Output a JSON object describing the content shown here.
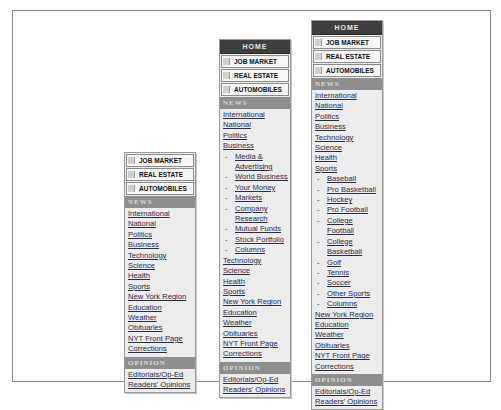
{
  "colors": {
    "home_bg": "#3e3e3e",
    "section_bg": "#8e8e8e",
    "panel_bg": "#ececec",
    "link": "#2a2a4a"
  },
  "columns": [
    {
      "has_home": false,
      "home_label": "",
      "classifieds": [
        "JOB MARKET",
        "REAL ESTATE",
        "AUTOMOBILES"
      ],
      "news_header": "NEWS",
      "news_items": [
        {
          "label": "International",
          "sub": false
        },
        {
          "label": "National",
          "sub": false
        },
        {
          "label": "Politics",
          "sub": false
        },
        {
          "label": "Business",
          "sub": false
        },
        {
          "label": "Technology",
          "sub": false
        },
        {
          "label": "Science",
          "sub": false
        },
        {
          "label": "Health",
          "sub": false
        },
        {
          "label": "Sports",
          "sub": false
        },
        {
          "label": "New York Region",
          "sub": false
        },
        {
          "label": "Education",
          "sub": false
        },
        {
          "label": "Weather",
          "sub": false
        },
        {
          "label": "Obituaries",
          "sub": false
        },
        {
          "label": "NYT Front Page",
          "sub": false
        },
        {
          "label": "Corrections",
          "sub": false
        }
      ],
      "opinion_header": "OPINION",
      "opinion_items": [
        "Editorials/Op-Ed",
        "Readers' Opinions"
      ]
    },
    {
      "has_home": true,
      "home_label": "HOME",
      "classifieds": [
        "JOB MARKET",
        "REAL ESTATE",
        "AUTOMOBILES"
      ],
      "news_header": "NEWS",
      "news_items": [
        {
          "label": "International",
          "sub": false
        },
        {
          "label": "National",
          "sub": false
        },
        {
          "label": "Politics",
          "sub": false
        },
        {
          "label": "Business",
          "sub": false
        },
        {
          "label": "Media & Advertising",
          "sub": true
        },
        {
          "label": "World Business",
          "sub": true
        },
        {
          "label": "Your Money",
          "sub": true
        },
        {
          "label": "Markets",
          "sub": true
        },
        {
          "label": "Company Research",
          "sub": true
        },
        {
          "label": "Mutual Funds",
          "sub": true
        },
        {
          "label": "Stock Portfolio",
          "sub": true
        },
        {
          "label": "Columns",
          "sub": true
        },
        {
          "label": "Technology",
          "sub": false
        },
        {
          "label": "Science",
          "sub": false
        },
        {
          "label": "Health",
          "sub": false
        },
        {
          "label": "Sports",
          "sub": false
        },
        {
          "label": "New York Region",
          "sub": false
        },
        {
          "label": "Education",
          "sub": false
        },
        {
          "label": "Weather",
          "sub": false
        },
        {
          "label": "Obituaries",
          "sub": false
        },
        {
          "label": "NYT Front Page",
          "sub": false
        },
        {
          "label": "Corrections",
          "sub": false
        }
      ],
      "opinion_header": "OPINION",
      "opinion_items": [
        "Editorials/Op-Ed",
        "Readers' Opinions"
      ]
    },
    {
      "has_home": true,
      "home_label": "HOME",
      "classifieds": [
        "JOB MARKET",
        "REAL ESTATE",
        "AUTOMOBILES"
      ],
      "news_header": "NEWS",
      "news_items": [
        {
          "label": "International",
          "sub": false
        },
        {
          "label": "National",
          "sub": false
        },
        {
          "label": "Politics",
          "sub": false
        },
        {
          "label": "Business",
          "sub": false
        },
        {
          "label": "Technology",
          "sub": false
        },
        {
          "label": "Science",
          "sub": false
        },
        {
          "label": "Health",
          "sub": false
        },
        {
          "label": "Sports",
          "sub": false
        },
        {
          "label": "Baseball",
          "sub": true
        },
        {
          "label": "Pro Basketball",
          "sub": true
        },
        {
          "label": "Hockey",
          "sub": true
        },
        {
          "label": "Pro Football",
          "sub": true
        },
        {
          "label": "College Football",
          "sub": true
        },
        {
          "label": "College Basketball",
          "sub": true
        },
        {
          "label": "Golf",
          "sub": true
        },
        {
          "label": "Tennis",
          "sub": true
        },
        {
          "label": "Soccer",
          "sub": true
        },
        {
          "label": "Other Sports",
          "sub": true
        },
        {
          "label": "Columns",
          "sub": true
        },
        {
          "label": "New York Region",
          "sub": false
        },
        {
          "label": "Education",
          "sub": false
        },
        {
          "label": "Weather",
          "sub": false
        },
        {
          "label": "Obituaries",
          "sub": false
        },
        {
          "label": "NYT Front Page",
          "sub": false
        },
        {
          "label": "Corrections",
          "sub": false
        }
      ],
      "opinion_header": "OPINION",
      "opinion_items": [
        "Editorials/Op-Ed",
        "Readers' Opinions"
      ]
    }
  ]
}
